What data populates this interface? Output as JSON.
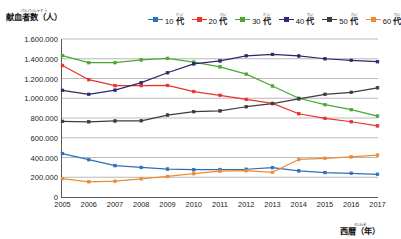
{
  "chart_data": {
    "type": "line",
    "title": "",
    "ylabel": "献血者数（人）",
    "ylabel_ruby": "けんけつしゃすう",
    "ylabel_unit_ruby": "にん",
    "xlabel": "西暦（年）",
    "xlabel_ruby": "せいれき",
    "xlabel_unit_ruby": "ねん",
    "x": [
      2005,
      2006,
      2007,
      2008,
      2009,
      2010,
      2011,
      2012,
      2013,
      2014,
      2015,
      2016,
      2017
    ],
    "xtick_labels": [
      "2005",
      "2006",
      "2007",
      "2008",
      "2009",
      "2010",
      "2011",
      "2012",
      "2013",
      "2014",
      "2015",
      "2016",
      "2017"
    ],
    "ylim": [
      0,
      1600000
    ],
    "ytick_values": [
      0,
      200000,
      400000,
      600000,
      800000,
      1000000,
      1200000,
      1400000,
      1600000
    ],
    "ytick_labels": [
      "0",
      "200.000",
      "400.000",
      "600.000",
      "800.000",
      "1.000.000",
      "1.200.000",
      "1.400.000",
      "1.600.000"
    ],
    "grid": true,
    "legend_position": "top-right",
    "series": [
      {
        "name": "10代",
        "ruby": "だい",
        "color": "#2e6fba",
        "values": [
          440000,
          378000,
          318000,
          299000,
          283000,
          276000,
          278000,
          281000,
          298000,
          265000,
          248000,
          240000,
          230000
        ]
      },
      {
        "name": "20代",
        "ruby": "だい",
        "color": "#e8332a",
        "values": [
          1332000,
          1188000,
          1128000,
          1128000,
          1130000,
          1068000,
          1030000,
          988000,
          948000,
          843000,
          796000,
          762000,
          720000
        ]
      },
      {
        "name": "30代",
        "ruby": "だい",
        "color": "#4aa832",
        "values": [
          1432000,
          1360000,
          1360000,
          1388000,
          1404000,
          1366000,
          1318000,
          1244000,
          1124000,
          1000000,
          935000,
          884000,
          820000
        ]
      },
      {
        "name": "40代",
        "ruby": "だい",
        "color": "#2b2a6e",
        "values": [
          1080000,
          1040000,
          1082000,
          1158000,
          1258000,
          1348000,
          1378000,
          1430000,
          1444000,
          1428000,
          1400000,
          1384000,
          1370000
        ]
      },
      {
        "name": "50代",
        "ruby": "だい",
        "color": "#3c3c3c",
        "values": [
          766000,
          762000,
          770000,
          772000,
          830000,
          864000,
          872000,
          914000,
          946000,
          994000,
          1040000,
          1060000,
          1106000
        ]
      },
      {
        "name": "60代",
        "ruby": "だい",
        "color": "#ed8b33",
        "values": [
          186000,
          154000,
          160000,
          184000,
          208000,
          236000,
          262000,
          266000,
          250000,
          380000,
          392000,
          406000,
          424000
        ]
      }
    ]
  }
}
